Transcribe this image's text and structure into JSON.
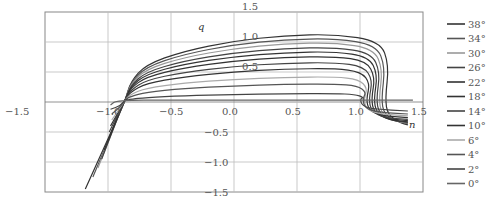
{
  "chart_data": {
    "type": "line",
    "title": "",
    "xlabel": "n",
    "ylabel": "q",
    "xlim": [
      -1.5,
      1.5
    ],
    "ylim": [
      -1.5,
      1.5
    ],
    "grid": true,
    "legend_position": "right",
    "x_ticks": [
      "−1.5",
      "−1.0",
      "−0.5",
      "0.0",
      "0.5",
      "1.0",
      "1.5"
    ],
    "y_ticks": [
      "1.5",
      "1.0",
      "0.5",
      "−0.5",
      "−1.0",
      "−1.5"
    ],
    "series": [
      {
        "name": "38°",
        "color": "#333333",
        "plateau": 1.13,
        "left_tail": [
          -1.18,
          -1.45
        ],
        "drop_n": 1.24,
        "end_q": -0.35
      },
      {
        "name": "34°",
        "color": "#555555",
        "plateau": 1.06,
        "left_tail": [
          -1.12,
          -1.25
        ],
        "drop_n": 1.21,
        "end_q": -0.33
      },
      {
        "name": "30°",
        "color": "#999999",
        "plateau": 0.99,
        "left_tail": [
          -1.08,
          -1.1
        ],
        "drop_n": 1.19,
        "end_q": -0.32
      },
      {
        "name": "26°",
        "color": "#444444",
        "plateau": 0.91,
        "left_tail": [
          -1.05,
          -0.95
        ],
        "drop_n": 1.17,
        "end_q": -0.31
      },
      {
        "name": "22°",
        "color": "#333333",
        "plateau": 0.84,
        "left_tail": [
          -1.03,
          -0.8
        ],
        "drop_n": 1.15,
        "end_q": -0.3
      },
      {
        "name": "18°",
        "color": "#333333",
        "plateau": 0.76,
        "left_tail": [
          -1.0,
          -0.65
        ],
        "drop_n": 1.13,
        "end_q": -0.28
      },
      {
        "name": "14°",
        "color": "#444444",
        "plateau": 0.66,
        "left_tail": [
          -0.99,
          -0.5
        ],
        "drop_n": 1.11,
        "end_q": -0.26
      },
      {
        "name": "10°",
        "color": "#333333",
        "plateau": 0.56,
        "left_tail": [
          -0.98,
          -0.4
        ],
        "drop_n": 1.09,
        "end_q": -0.23
      },
      {
        "name": "6°",
        "color": "#aaaaaa",
        "plateau": 0.42,
        "left_tail": [
          -0.97,
          -0.3
        ],
        "drop_n": 1.07,
        "end_q": -0.2
      },
      {
        "name": "4°",
        "color": "#555555",
        "plateau": 0.3,
        "left_tail": [
          -0.97,
          -0.2
        ],
        "drop_n": 1.06,
        "end_q": -0.17
      },
      {
        "name": "2°",
        "color": "#444444",
        "plateau": 0.14,
        "left_tail": [
          -0.98,
          -0.12
        ],
        "drop_n": 1.04,
        "end_q": -0.12
      },
      {
        "name": "0°",
        "color": "#666666",
        "plateau": 0.03,
        "left_tail": [
          -1.0,
          0.02
        ],
        "drop_n": 1.42,
        "end_q": 0.03
      }
    ]
  }
}
